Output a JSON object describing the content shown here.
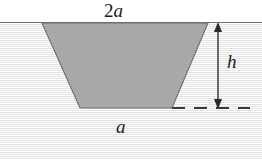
{
  "figure": {
    "name": "trapezoidal-channel-cross-section",
    "labels": {
      "top_width_number": "2",
      "top_width_variable": "a",
      "top_width_full": "2a",
      "bottom_width": "a",
      "depth": "h"
    },
    "colors": {
      "trapezoid_fill": "#a8a8a8",
      "trapezoid_stroke": "#6e6e6e",
      "ground_fill": "#f3f3f3",
      "ground_line": "#6e6e6e",
      "sky_fill": "#ffffff",
      "dimension_arrow": "#3a3a3a",
      "dashed_line": "#3a3a3a",
      "text": "#1b1b1b"
    },
    "geometry": {
      "ground_line_y": 23,
      "trapezoid_top_left_x": 42,
      "trapezoid_top_right_x": 208,
      "trapezoid_bottom_left_x": 80,
      "trapezoid_bottom_right_x": 172,
      "trapezoid_bottom_y": 108,
      "dimension_arrow_x": 218,
      "dashed_line_start_x": 172,
      "dashed_line_end_x": 250,
      "top_width_px": 166,
      "bottom_width_px": 92,
      "depth_px": 85
    }
  }
}
